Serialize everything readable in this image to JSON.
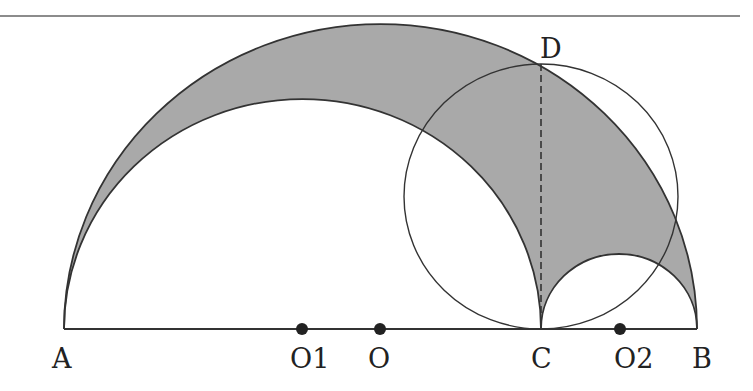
{
  "colors": {
    "background": "#ffffff",
    "stroke": "#333333",
    "shade": "#a9a9a9",
    "rule": "#666666"
  },
  "labels": {
    "A": "A",
    "O1": "O1",
    "O": "O",
    "C": "C",
    "O2": "O2",
    "B": "B",
    "D": "D"
  },
  "geometry": {
    "baseline_y": 329,
    "points": {
      "A": [
        64,
        329
      ],
      "O1": [
        302,
        329
      ],
      "O": [
        380,
        329
      ],
      "C": [
        541,
        329
      ],
      "O2": [
        620,
        329
      ],
      "B": [
        697,
        329
      ],
      "D": [
        541,
        64
      ]
    },
    "big_semicircle": {
      "center": "O",
      "diameter": "AB"
    },
    "left_semicircle": {
      "center": "O1",
      "diameter": "AC"
    },
    "right_semicircle": {
      "center": "O2",
      "diameter": "CB"
    },
    "circle_on_CD": {
      "diameter": "CD"
    },
    "dashed_segment": "CD",
    "shaded_region": "inside semicircle AB, outside semicircles AC and CB"
  }
}
